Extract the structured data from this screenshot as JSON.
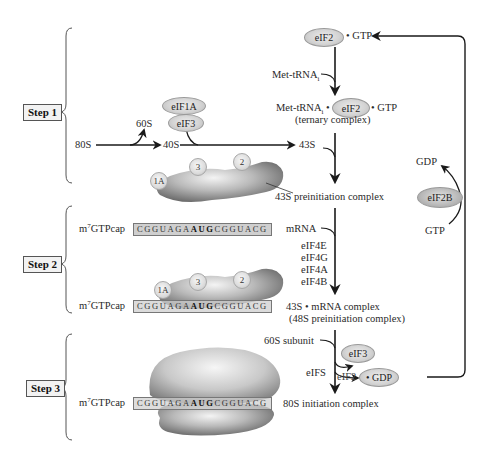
{
  "steps": [
    {
      "label": "Step 1"
    },
    {
      "label": "Step 2"
    },
    {
      "label": "Step 3"
    }
  ],
  "step1": {
    "eif2_gtp": {
      "factor": "eIF2",
      "suffix": "• GTP"
    },
    "met_trna_label": "Met-tRNA",
    "met_trna_sub": "i",
    "ternary": {
      "prefix": "Met-tRNA",
      "prefix_sub": "i",
      "sep1": "•",
      "factor": "eIF2",
      "suffix": "• GTP",
      "note": "(ternary complex)"
    },
    "ribosome_80s": "80S",
    "subunit_60s": "60S",
    "subunit_40s": "40S",
    "complex_43s": "43S",
    "eif1a": "eIF1A",
    "eif3": "eIF3",
    "preinit_markers": [
      "1A",
      "3",
      "2"
    ],
    "preinit_label": "43S preinitiation complex"
  },
  "recycling": {
    "gdp": "GDP",
    "gtp": "GTP",
    "factor": "eIF2B"
  },
  "step2": {
    "cap_prefix": "m",
    "cap_sup": "7",
    "cap_suffix": "GTPcap",
    "sequence_parts": [
      {
        "text": "CGGUAGA",
        "bold": false
      },
      {
        "text": "AUG",
        "bold": true
      },
      {
        "text": "CGGUACG",
        "bold": false
      }
    ],
    "mrna_label": "mRNA",
    "factors": [
      "eIF4E",
      "eIF4G",
      "eIF4A",
      "eIF4B"
    ],
    "markers": [
      "1A",
      "3",
      "2"
    ],
    "complex_label": "43S • mRNA complex",
    "complex_note": "(48S preinitiation complex)"
  },
  "step3": {
    "subunit_label": "60S subunit",
    "eifs_label": "eIFS",
    "eif3": "eIF3",
    "eif2_partial": "eIF2",
    "gdp_suffix": "• GDP",
    "complex_label": "80S initiation complex"
  },
  "colors": {
    "line": "#1a1a1a",
    "oval_fill": "#d4d4d4",
    "ribosome_light": "#e8e8e8",
    "ribosome_dark": "#6e6e6e",
    "seq_fill": "#cfcfcf"
  }
}
